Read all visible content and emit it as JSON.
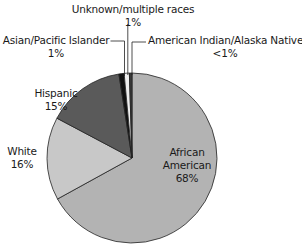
{
  "chart_data": {
    "type": "pie",
    "title": "",
    "start_angle_deg": 0,
    "direction": "clockwise",
    "slices": [
      {
        "label": "African American",
        "value": 68,
        "display": "68%",
        "color": "#b3b3b3"
      },
      {
        "label": "White",
        "value": 16,
        "display": "16%",
        "color": "#c8c8c8"
      },
      {
        "label": "Hispanic",
        "value": 15,
        "display": "15%",
        "color": "#5a5a5a"
      },
      {
        "label": "Asian/Pacific Islander",
        "value": 1,
        "display": "1%",
        "color": "#111111"
      },
      {
        "label": "Unknown/multiple races",
        "value": 1,
        "display": "1%",
        "color": "#eeeeee"
      },
      {
        "label": "American Indian/Alaska Native",
        "value": 0.5,
        "display": "<1%",
        "color": "#3a3a3a"
      }
    ]
  },
  "labels": {
    "african_american": {
      "name": "African",
      "name2": "American",
      "pct": "68%"
    },
    "white": {
      "name": "White",
      "pct": "16%"
    },
    "hispanic": {
      "name": "Hispanic",
      "pct": "15%"
    },
    "asian": {
      "name": "Asian/Pacific Islander",
      "pct": "1%"
    },
    "unknown": {
      "name": "Unknown/multiple races",
      "pct": "1%"
    },
    "american_indian": {
      "name": "American Indian/Alaska Native",
      "pct": "<1%"
    }
  }
}
